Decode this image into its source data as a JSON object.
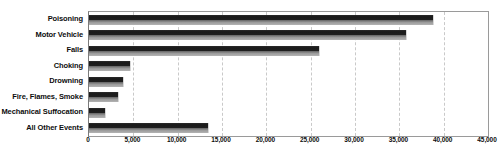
{
  "chart_data": {
    "type": "bar",
    "orientation": "horizontal",
    "title": "",
    "subtitle": "",
    "xlabel": "",
    "ylabel": "",
    "categories": [
      "Poisoning",
      "Motor Vehicle",
      "Falls",
      "Choking",
      "Drowning",
      "Fire, Flames, Smoke",
      "Mechanical Suffocation",
      "All Other Events"
    ],
    "values": [
      38900,
      35900,
      26100,
      4700,
      3900,
      3400,
      1900,
      13500
    ],
    "xlim": [
      0,
      45000
    ],
    "xticks": [
      0,
      5000,
      10000,
      15000,
      20000,
      25000,
      30000,
      35000,
      40000,
      45000
    ],
    "xtick_labels": [
      "0",
      "5,000",
      "10,000",
      "15,000",
      "20,000",
      "25,000",
      "30,000",
      "35,000",
      "40,000",
      "45,000"
    ],
    "grid": "vertical-dashed",
    "legend": "none",
    "bar_color_top": "#1a1a1a",
    "bar_color_bottom": "#b4b4b4",
    "gridline_color": "#c9c9c9",
    "plot_border_color": "#9a9a9a",
    "text_color": "#0d0d0d"
  }
}
